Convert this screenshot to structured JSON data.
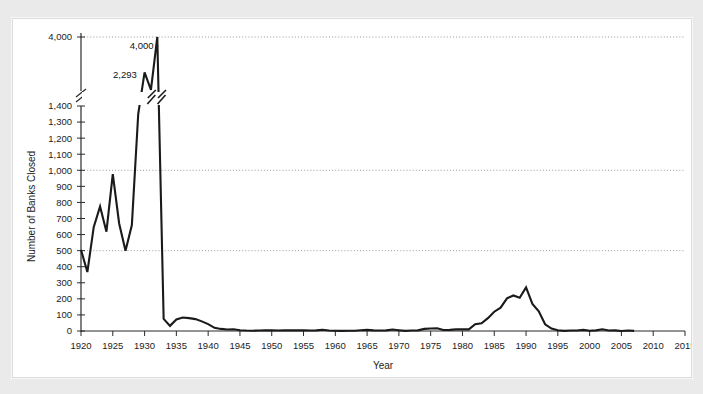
{
  "chart_data": {
    "type": "line",
    "title": "",
    "xlabel": "Year",
    "ylabel": "Number of Banks Closed",
    "xlim": [
      1920,
      2015
    ],
    "ylim": [
      0,
      4000
    ],
    "grid": true,
    "gridlines_at": [
      500,
      1000,
      4000
    ],
    "legend": "none",
    "axis_break": {
      "present": true,
      "lower_max": 1400,
      "upper_value": 4000,
      "note": "y-axis is broken between 1,400 and 4,000"
    },
    "y_ticks": [
      0,
      100,
      200,
      300,
      400,
      500,
      600,
      700,
      800,
      900,
      1000,
      1100,
      1200,
      1300,
      1400,
      4000
    ],
    "y_tick_labels": [
      "0",
      "100",
      "200",
      "300",
      "400",
      "500",
      "600",
      "700",
      "800",
      "900",
      "1,000",
      "1,100",
      "1,200",
      "1,300",
      "1,400",
      "4,000"
    ],
    "x_ticks": [
      1920,
      1925,
      1930,
      1935,
      1940,
      1945,
      1950,
      1955,
      1960,
      1965,
      1970,
      1975,
      1980,
      1985,
      1990,
      1995,
      2000,
      2005,
      2010,
      2015
    ],
    "x_tick_labels": [
      "1920",
      "1925",
      "1930",
      "1935",
      "1940",
      "1945",
      "1950",
      "1955",
      "1960",
      "1965",
      "1970",
      "1975",
      "1980",
      "1985",
      "1990",
      "1995",
      "2000",
      "2005",
      "2010",
      "2015"
    ],
    "annotations": [
      {
        "text": "4,000",
        "x": 1933,
        "y": 4000
      },
      {
        "text": "2,293",
        "x": 1931,
        "y": 2293
      }
    ],
    "x": [
      1920,
      1921,
      1922,
      1923,
      1924,
      1925,
      1926,
      1927,
      1928,
      1929,
      1930,
      1931,
      1932,
      1933,
      1934,
      1935,
      1936,
      1937,
      1938,
      1939,
      1940,
      1941,
      1942,
      1943,
      1944,
      1945,
      1946,
      1947,
      1948,
      1949,
      1950,
      1951,
      1952,
      1953,
      1954,
      1955,
      1956,
      1957,
      1958,
      1959,
      1960,
      1961,
      1962,
      1963,
      1964,
      1965,
      1966,
      1967,
      1968,
      1969,
      1970,
      1971,
      1972,
      1973,
      1974,
      1975,
      1976,
      1977,
      1978,
      1979,
      1980,
      1981,
      1982,
      1983,
      1984,
      1985,
      1986,
      1987,
      1988,
      1989,
      1990,
      1991,
      1992,
      1993,
      1994,
      1995,
      1996,
      1997,
      1998,
      1999,
      2000,
      2001,
      2002,
      2003,
      2004,
      2005,
      2006,
      2007
    ],
    "values": [
      505,
      367,
      646,
      775,
      618,
      976,
      669,
      499,
      659,
      1350,
      2293,
      1453,
      4000,
      75,
      32,
      72,
      84,
      80,
      74,
      60,
      43,
      20,
      13,
      9,
      11,
      5,
      3,
      2,
      3,
      4,
      4,
      3,
      4,
      4,
      4,
      4,
      3,
      4,
      8,
      3,
      2,
      1,
      2,
      2,
      5,
      7,
      4,
      3,
      4,
      9,
      5,
      1,
      3,
      4,
      13,
      16,
      17,
      6,
      7,
      10,
      10,
      10,
      42,
      48,
      80,
      120,
      145,
      203,
      221,
      207,
      271,
      169,
      122,
      42,
      15,
      5,
      1,
      3,
      3,
      7,
      2,
      4,
      11,
      3,
      4,
      0,
      3,
      1
    ]
  },
  "axis_title_year": "Year",
  "axis_title_banks": "Number of Banks Closed"
}
